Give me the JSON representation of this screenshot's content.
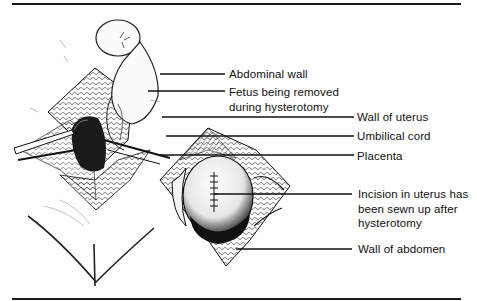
{
  "figure": {
    "labels": [
      {
        "id": "abdominal-wall",
        "lines": [
          "Abdominal wall"
        ]
      },
      {
        "id": "fetus",
        "lines": [
          "Fetus being removed",
          "during hysterotomy"
        ]
      },
      {
        "id": "wall-of-uterus",
        "lines": [
          "Wall of uterus"
        ]
      },
      {
        "id": "umbilical-cord",
        "lines": [
          "Umbilical cord"
        ]
      },
      {
        "id": "placenta",
        "lines": [
          "Placenta"
        ]
      },
      {
        "id": "incision",
        "lines": [
          "Incision in uterus has",
          "been sewn up after",
          "hysterotomy"
        ]
      },
      {
        "id": "wall-of-abdomen",
        "lines": [
          "Wall of abdomen"
        ]
      }
    ],
    "colors": {
      "ink": "#111111",
      "paper": "#fefefe",
      "shade": "#555555"
    }
  }
}
